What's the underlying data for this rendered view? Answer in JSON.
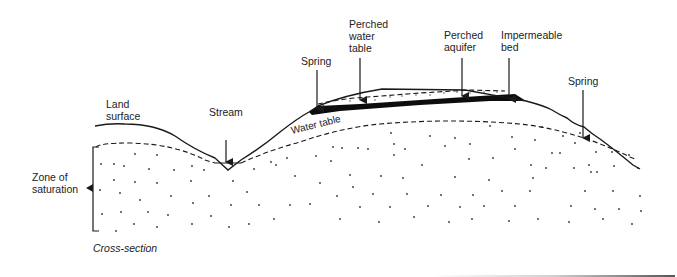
{
  "diagram": {
    "title": "Cross-section",
    "labels": {
      "land_surface": "Land\nsurface",
      "stream": "Stream",
      "spring_left": "Spring",
      "perched_water_table": "Perched\nwater\ntable",
      "perched_aquifer": "Perched\naquifer",
      "impermeable_bed": "Impermeable\nbed",
      "spring_right": "Spring",
      "water_table": "Water table",
      "zone_of_saturation": "Zone of\nsaturation",
      "cross_section": "Cross-section"
    },
    "colors": {
      "line": "#1a1a1a",
      "impermeable_bed_fill": "#0d0d0d",
      "dots": "#333333",
      "background": "#ffffff"
    },
    "nodes": [
      {
        "id": "land-surface",
        "label": "Land surface"
      },
      {
        "id": "stream",
        "label": "Stream"
      },
      {
        "id": "spring-left",
        "label": "Spring"
      },
      {
        "id": "perched-water-table",
        "label": "Perched water table"
      },
      {
        "id": "perched-aquifer",
        "label": "Perched aquifer"
      },
      {
        "id": "impermeable-bed",
        "label": "Impermeable bed"
      },
      {
        "id": "spring-right",
        "label": "Spring"
      },
      {
        "id": "water-table",
        "label": "Water table"
      },
      {
        "id": "zone-of-saturation",
        "label": "Zone of saturation"
      }
    ]
  }
}
